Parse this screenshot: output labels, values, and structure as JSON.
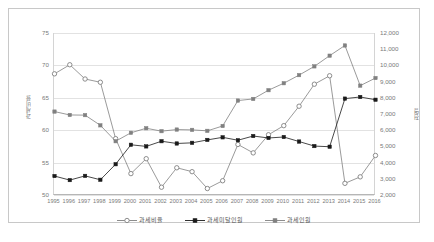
{
  "chart_data": {
    "type": "line",
    "title": "",
    "xlabel": "",
    "ylabel": "과세비율",
    "ylabel_right": "천명",
    "categories": [
      "1995",
      "1996",
      "1997",
      "1998",
      "1999",
      "2000",
      "2001",
      "2002",
      "2003",
      "2004",
      "2005",
      "2006",
      "2007",
      "2008",
      "2009",
      "2010",
      "2011",
      "2012",
      "2013",
      "2014",
      "2015",
      "2016"
    ],
    "ylim": [
      50,
      75
    ],
    "yticks": [
      50,
      55,
      60,
      65,
      70,
      75
    ],
    "ylim_right": [
      2000,
      12000
    ],
    "yticks_right": [
      "2,000",
      "3,000",
      "4,000",
      "5,000",
      "6,000",
      "7,000",
      "8,000",
      "9,000",
      "10,000",
      "11,000",
      "12,000"
    ],
    "grid": true,
    "legend_position": "bottom",
    "series": [
      {
        "name": "과세비율",
        "axis": "left",
        "marker": "open-circle",
        "color": "#808080",
        "values": [
          68.7,
          70.1,
          67.9,
          67.4,
          58.7,
          53.3,
          55.6,
          51.2,
          54.2,
          53.6,
          51.0,
          52.2,
          57.8,
          56.5,
          59.3,
          60.7,
          63.7,
          67.1,
          68.4,
          51.8,
          52.8,
          56.1
        ]
      },
      {
        "name": "과세미달인원",
        "axis": "right",
        "marker": "filled-square",
        "color": "#1a1a1a",
        "values": [
          3170,
          2920,
          3180,
          2940,
          3900,
          5100,
          5000,
          5320,
          5180,
          5220,
          5400,
          5560,
          5380,
          5640,
          5520,
          5580,
          5300,
          5020,
          4980,
          7950,
          8050,
          7880
        ]
      },
      {
        "name": "과세인원",
        "axis": "right",
        "marker": "filled-square-gray",
        "color": "#808080",
        "values": [
          7150,
          6940,
          6930,
          6300,
          5320,
          5840,
          6120,
          5940,
          6040,
          6020,
          5960,
          6260,
          7830,
          7930,
          8470,
          8900,
          9400,
          9940,
          10600,
          11230,
          8750,
          9220
        ]
      }
    ]
  },
  "legend": {
    "items": [
      {
        "label": "과세비율"
      },
      {
        "label": "과세미달인원"
      },
      {
        "label": "과세인원"
      }
    ]
  },
  "caption": {
    "text": ""
  }
}
